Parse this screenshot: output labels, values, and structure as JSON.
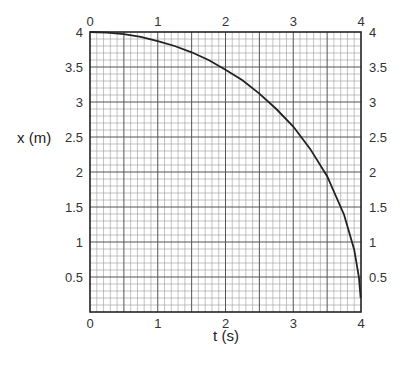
{
  "chart_data": {
    "type": "line",
    "title": "",
    "xlabel": "t (s)",
    "ylabel": "x (m)",
    "xlim": [
      0,
      4
    ],
    "ylim": [
      0,
      4
    ],
    "grid": true,
    "minor_grid_step": 0.1,
    "x_ticks": [
      "0",
      "1",
      "2",
      "3",
      "4"
    ],
    "y_ticks": [
      "0.5",
      "1",
      "1.5",
      "2",
      "2.5",
      "3",
      "3.5",
      "4"
    ],
    "series": [
      {
        "name": "x(t)",
        "color": "#222222",
        "x": [
          0,
          0.25,
          0.5,
          0.75,
          1.0,
          1.25,
          1.5,
          1.75,
          2.0,
          2.25,
          2.5,
          2.75,
          3.0,
          3.25,
          3.5,
          3.75,
          3.9,
          3.97,
          3.995
        ],
        "y": [
          4.0,
          3.99,
          3.97,
          3.93,
          3.87,
          3.8,
          3.71,
          3.6,
          3.46,
          3.31,
          3.12,
          2.9,
          2.65,
          2.33,
          1.94,
          1.39,
          0.89,
          0.49,
          0.2
        ]
      }
    ]
  }
}
